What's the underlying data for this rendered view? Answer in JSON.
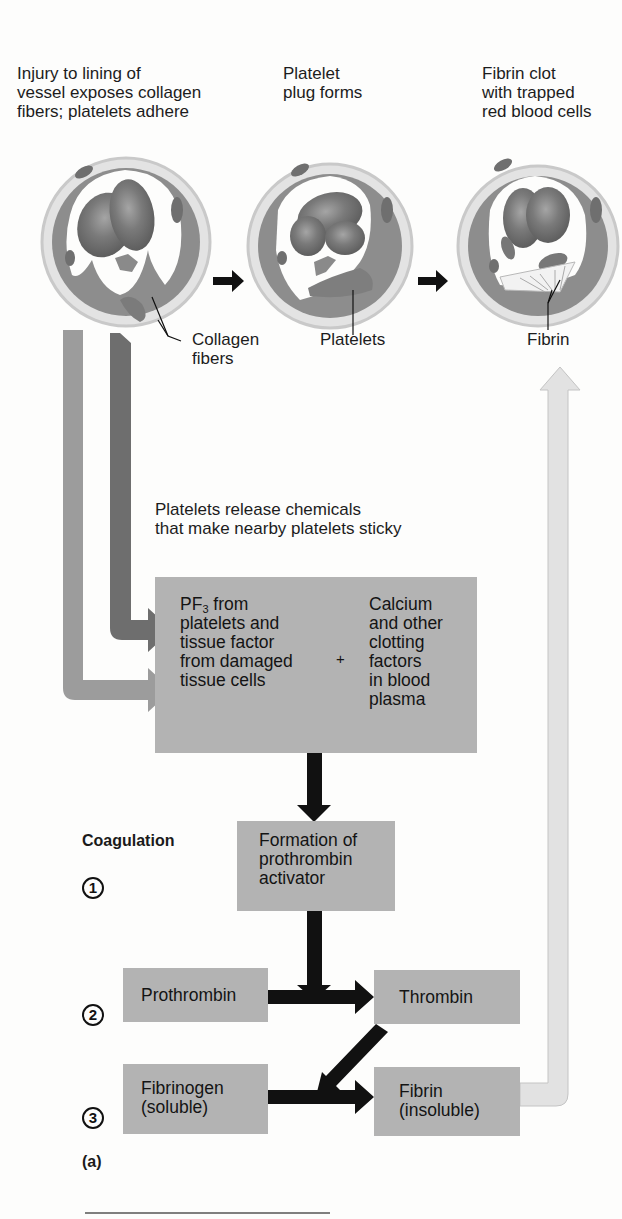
{
  "figure": {
    "panel_label": "(a)",
    "stages": [
      {
        "caption_lines": [
          "Injury to lining of",
          "vessel exposes collagen",
          "fibers; platelets adhere"
        ],
        "pointer_label_lines": [
          "Collagen",
          "fibers"
        ]
      },
      {
        "caption_lines": [
          "Platelet",
          "plug forms"
        ],
        "pointer_label_lines": [
          "Platelets"
        ]
      },
      {
        "caption_lines": [
          "Fibrin clot",
          "with trapped",
          "red blood cells"
        ],
        "pointer_label_lines": [
          "Fibrin"
        ]
      }
    ],
    "release_note_lines": [
      "Platelets release chemicals",
      "that make nearby platelets sticky"
    ],
    "factors_box": {
      "left_lines": [
        "PF",
        "platelets and",
        "tissue factor",
        "from damaged",
        "tissue cells"
      ],
      "left_first_line_suffix": " from",
      "pf_subscript": "3",
      "plus": "+",
      "right_lines": [
        "Calcium",
        "and other",
        "clotting",
        "factors",
        "in blood",
        "plasma"
      ]
    },
    "coagulation_heading": "Coagulation",
    "steps": [
      {
        "number": "1",
        "boxes": [
          {
            "lines": [
              "Formation of",
              "prothrombin",
              "activator"
            ]
          }
        ]
      },
      {
        "number": "2",
        "boxes": [
          {
            "lines": [
              "Prothrombin"
            ]
          },
          {
            "lines": [
              "Thrombin"
            ]
          }
        ]
      },
      {
        "number": "3",
        "boxes": [
          {
            "lines": [
              "Fibrinogen",
              "(soluble)"
            ]
          },
          {
            "lines": [
              "Fibrin",
              "(insoluble)"
            ]
          }
        ]
      }
    ]
  },
  "colors": {
    "box_fill": "#b3b3b3",
    "black_arrow": "#111111",
    "light_arrow": "#9c9c9c",
    "dark_arrow": "#6e6e6e",
    "return_arrow": "#e2e2e2",
    "vessel_wall": "#8a8a8a",
    "rbc": "#6f6f6f"
  }
}
